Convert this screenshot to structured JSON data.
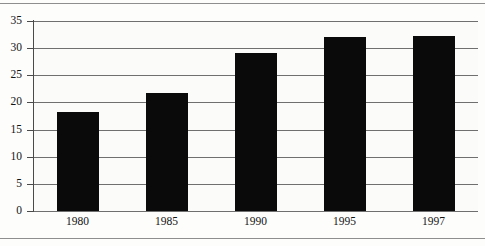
{
  "chart_data": {
    "type": "bar",
    "title": "",
    "subtitle": "",
    "xlabel": "",
    "ylabel": "",
    "categories": [
      "1980",
      "1985",
      "1990",
      "1995",
      "1997"
    ],
    "values": [
      18.2,
      21.8,
      29.2,
      32.0,
      32.2
    ],
    "series": [
      {
        "name": "",
        "values": [
          18.2,
          21.8,
          29.2,
          32.0,
          32.2
        ]
      }
    ],
    "ylim": [
      0,
      35
    ],
    "yticks": [
      0,
      5,
      10,
      15,
      20,
      25,
      30,
      35
    ],
    "ytick_labels": [
      "0",
      "5",
      "10",
      "15",
      "20",
      "25",
      "30",
      "35"
    ],
    "xtick_labels": [
      "1980",
      "1985",
      "1990",
      "1995",
      "1997"
    ],
    "grid": true,
    "grid_axis": "y",
    "legend": false,
    "legend_position": "none",
    "annotations": [],
    "colors": {
      "bar": "#0a0a0a",
      "gridline": "#6f6f6f",
      "axis": "#4a4a4a",
      "background": "#fbfbfa",
      "text": "#141414",
      "rule": "#8e8e8e"
    }
  },
  "figure": {
    "top_rule": "",
    "bottom_rule": ""
  }
}
